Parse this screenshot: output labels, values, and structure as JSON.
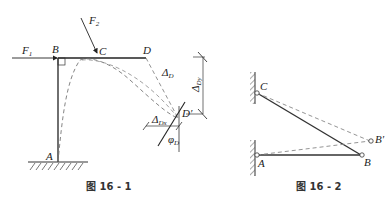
{
  "figure1": {
    "caption": "图 16 - 1",
    "labels": {
      "F1": "F",
      "F1_sub": "1",
      "F2": "F",
      "F2_sub": "2",
      "B": "B",
      "C": "C",
      "D": "D",
      "A": "A",
      "Dprime": "D′",
      "delta_D": "Δ",
      "delta_D_sub": "D",
      "delta_Dy": "Δ",
      "delta_Dy_sub": "Dy",
      "delta_Dx": "Δ",
      "delta_Dx_sub": "Dx",
      "phi_D": "φ",
      "phi_D_sub": "D"
    }
  },
  "figure2": {
    "caption": "图 16 - 2",
    "labels": {
      "C": "C",
      "A": "A",
      "B": "B",
      "Bprime": "B′"
    }
  }
}
